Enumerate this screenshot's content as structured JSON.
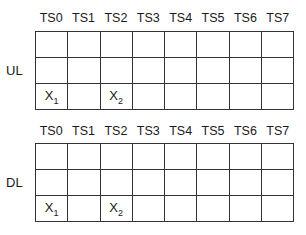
{
  "diagrams": [
    {
      "label": "UL",
      "columns": [
        "TS0",
        "TS1",
        "TS2",
        "TS3",
        "TS4",
        "TS5",
        "TS6",
        "TS7"
      ],
      "rows": [
        [
          "",
          "",
          "",
          "",
          "",
          "",
          "",
          ""
        ],
        [
          "",
          "",
          "",
          "",
          "",
          "",
          "",
          ""
        ],
        [
          {
            "base": "X",
            "sub": "1"
          },
          "",
          {
            "base": "X",
            "sub": "2"
          },
          "",
          "",
          "",
          "",
          ""
        ]
      ]
    },
    {
      "label": "DL",
      "columns": [
        "TS0",
        "TS1",
        "TS2",
        "TS3",
        "TS4",
        "TS5",
        "TS6",
        "TS7"
      ],
      "rows": [
        [
          "",
          "",
          "",
          "",
          "",
          "",
          "",
          ""
        ],
        [
          "",
          "",
          "",
          "",
          "",
          "",
          "",
          ""
        ],
        [
          {
            "base": "X",
            "sub": "1"
          },
          "",
          {
            "base": "X",
            "sub": "2"
          },
          "",
          "",
          "",
          "",
          ""
        ]
      ]
    }
  ]
}
